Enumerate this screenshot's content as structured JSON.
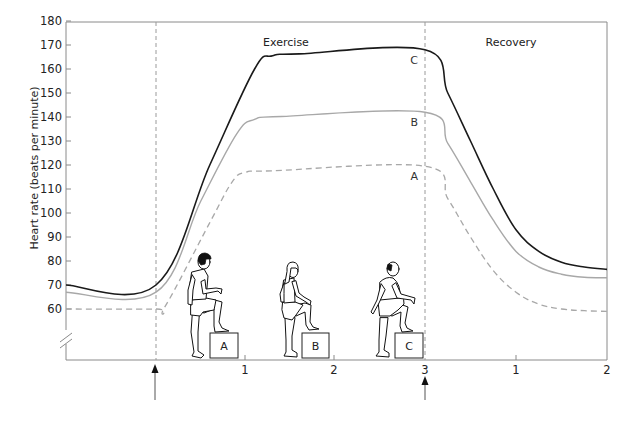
{
  "chart_data": {
    "type": "line",
    "title": "",
    "xlabel": "",
    "ylabel": "Heart rate (beats per minute)",
    "ylim": [
      50,
      180
    ],
    "yticks": [
      60,
      70,
      80,
      90,
      100,
      110,
      120,
      130,
      140,
      150,
      160,
      170,
      180
    ],
    "y_axis_break": true,
    "grid": false,
    "regions": [
      {
        "label": "Exercise",
        "x_ticks": [
          "1",
          "2",
          "3"
        ],
        "duration_min": 3
      },
      {
        "label": "Recovery",
        "x_ticks": [
          "1",
          "2"
        ],
        "duration_min": 2
      }
    ],
    "markers": [
      {
        "type": "arrow-up",
        "position": "exercise start"
      },
      {
        "type": "arrow-up",
        "position": "exercise end (3 min)"
      }
    ],
    "x_note": "x = minutes; negative values = resting period before exercise; exercise 0–3 min; recovery 3–5 min (labelled 1, 2)",
    "series": [
      {
        "name": "C",
        "style": "solid-black",
        "color": "#1a1a1a",
        "points": [
          [
            -1.0,
            70
          ],
          [
            0.0,
            70
          ],
          [
            0.6,
            120
          ],
          [
            1.1,
            160
          ],
          [
            1.3,
            165.5
          ],
          [
            1.6,
            166.3
          ],
          [
            3.0,
            168
          ],
          [
            3.25,
            150
          ],
          [
            3.5,
            130
          ],
          [
            3.75,
            110
          ],
          [
            4.0,
            93
          ],
          [
            4.25,
            84
          ],
          [
            4.5,
            79.5
          ],
          [
            4.75,
            77.5
          ],
          [
            5.0,
            76.5
          ]
        ]
      },
      {
        "name": "B",
        "style": "solid-gray",
        "color": "#a8a8a8",
        "points": [
          [
            -1.0,
            67
          ],
          [
            0.0,
            67
          ],
          [
            0.5,
            105
          ],
          [
            0.9,
            133
          ],
          [
            1.1,
            139
          ],
          [
            1.4,
            140.2
          ],
          [
            3.0,
            142
          ],
          [
            3.25,
            129
          ],
          [
            3.5,
            113
          ],
          [
            3.75,
            97
          ],
          [
            4.0,
            84
          ],
          [
            4.25,
            77.5
          ],
          [
            4.5,
            74.5
          ],
          [
            4.75,
            73.2
          ],
          [
            5.0,
            73
          ]
        ]
      },
      {
        "name": "A",
        "style": "dashed-gray",
        "color": "#a8a8a8",
        "points": [
          [
            -1.0,
            60
          ],
          [
            0.0,
            60
          ],
          [
            0.1,
            61
          ],
          [
            0.6,
            96
          ],
          [
            0.85,
            113
          ],
          [
            1.0,
            117
          ],
          [
            1.3,
            117.6
          ],
          [
            3.0,
            119.5
          ],
          [
            3.25,
            106
          ],
          [
            3.5,
            90
          ],
          [
            3.75,
            76
          ],
          [
            4.0,
            67
          ],
          [
            4.25,
            62
          ],
          [
            4.5,
            60
          ],
          [
            4.75,
            59.3
          ],
          [
            5.0,
            59
          ]
        ]
      }
    ],
    "annotations": [
      {
        "text": "Exercise",
        "region": "exercise"
      },
      {
        "text": "Recovery",
        "region": "recovery"
      },
      {
        "text": "C",
        "near": "series C end of exercise"
      },
      {
        "text": "B",
        "near": "series B end of exercise"
      },
      {
        "text": "A",
        "near": "series A end of exercise"
      },
      {
        "text": "A",
        "kind": "step box illustration (fit young man)"
      },
      {
        "text": "B",
        "kind": "step box illustration (woman)"
      },
      {
        "text": "C",
        "kind": "step box illustration (older overweight man)"
      }
    ]
  },
  "labels": {
    "y_title": "Heart rate (beats per minute)",
    "exercise": "Exercise",
    "recovery": "Recovery",
    "series_c": "C",
    "series_b": "B",
    "series_a": "A",
    "box_a": "A",
    "box_b": "B",
    "box_c": "C",
    "x_ex_1": "1",
    "x_ex_2": "2",
    "x_ex_3": "3",
    "x_rec_1": "1",
    "x_rec_2": "2",
    "y": [
      "180",
      "170",
      "160",
      "150",
      "140",
      "130",
      "120",
      "110",
      "100",
      "90",
      "80",
      "70",
      "60"
    ]
  }
}
